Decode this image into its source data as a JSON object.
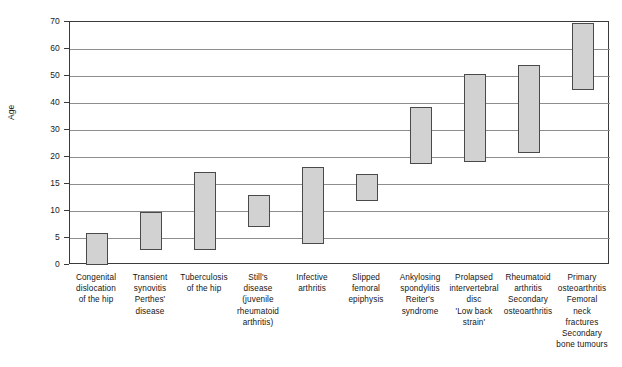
{
  "chart_data": {
    "type": "bar",
    "title": "",
    "subtitle": "",
    "xlabel": "",
    "ylabel": "Age",
    "orientation": "vertical",
    "bar_style": "floating range bars (age range per condition)",
    "grid": true,
    "legend": null,
    "ylim": [
      0,
      70
    ],
    "y_scale": "piecewise / non-linear (equal spacing between listed ticks)",
    "yticks": [
      0,
      5,
      10,
      15,
      20,
      30,
      40,
      50,
      60,
      70
    ],
    "ytick_labels": [
      "0",
      "5",
      "10",
      "15",
      "20",
      "30",
      "40",
      "50",
      "60",
      "70"
    ],
    "categories": [
      "Congenital\ndislocation\nof the hip",
      "Transient\nsynovitis\nPerthes'\ndisease",
      "Tuberculosis\nof the hip",
      "Still's\ndisease\n(juvenile\nrheumatoid\narthritis)",
      "Infective\narthritis",
      "Slipped\nfemoral\nepiphysis",
      "Ankylosing\nspondylitis\nReiter's\nsyndrome",
      "Prolapsed\nintervertebral\ndisc\n'Low back\nstrain'",
      "Rheumatoid\narthritis\nSecondary\nosteoarthritis",
      "Primary\nosteoarthritis\nFemoral\nneck\nfractures\nSecondary\nbone tumours"
    ],
    "ranges": [
      {
        "category": "Congenital dislocation of the hip",
        "low": 0,
        "high": 6.0
      },
      {
        "category": "Transient synovitis / Perthes' disease",
        "low": 2.8,
        "high": 9.9
      },
      {
        "category": "Tuberculosis of the hip",
        "low": 2.8,
        "high": 17.2
      },
      {
        "category": "Still's disease (juvenile rheumatoid arthritis)",
        "low": 7.0,
        "high": 13.0
      },
      {
        "category": "Infective arthritis",
        "low": 3.9,
        "high": 18.2
      },
      {
        "category": "Slipped femoral epiphysis",
        "low": 11.9,
        "high": 16.8
      },
      {
        "category": "Ankylosing spondylitis / Reiter's syndrome",
        "low": 18.7,
        "high": 38.4
      },
      {
        "category": "Prolapsed intervertebral disc / 'Low back strain'",
        "low": 19.0,
        "high": 50.7
      },
      {
        "category": "Rheumatoid arthritis / Secondary osteoarthritis",
        "low": 21.5,
        "high": 54.0
      },
      {
        "category": "Primary osteoarthritis / Femoral neck fractures / Secondary bone tumours",
        "low": 44.8,
        "high": 69.5
      }
    ],
    "low_values": [
      0,
      2.8,
      2.8,
      7.0,
      3.9,
      11.9,
      18.7,
      19.0,
      21.5,
      44.8
    ],
    "high_values": [
      6.0,
      9.9,
      17.2,
      13.0,
      18.2,
      16.8,
      38.4,
      50.7,
      54.0,
      69.5
    ],
    "colors": {
      "bar_fill": "#d2d2d2",
      "bar_stroke": "#4a4a4a",
      "gridline": "#8e8e8e",
      "axis": "#3a3a3a",
      "text": "#151515",
      "background": "#ffffff"
    }
  }
}
